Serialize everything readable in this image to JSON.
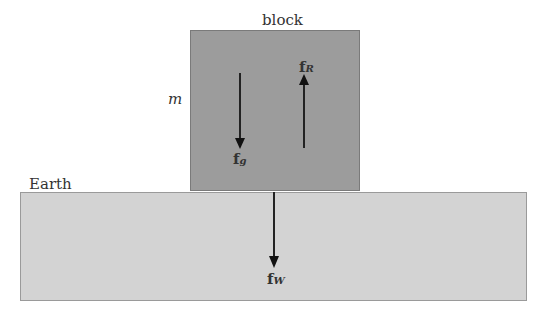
{
  "block": {
    "label": "block",
    "mass_label": "m",
    "color": "#9c9c9c"
  },
  "earth": {
    "label": "Earth",
    "color": "#d3d3d3"
  },
  "forces": {
    "fg": {
      "base": "f",
      "sub": "g",
      "direction": "down"
    },
    "fR": {
      "base": "f",
      "sub": "R",
      "direction": "up"
    },
    "fW": {
      "base": "f",
      "sub": "W",
      "direction": "down"
    }
  }
}
